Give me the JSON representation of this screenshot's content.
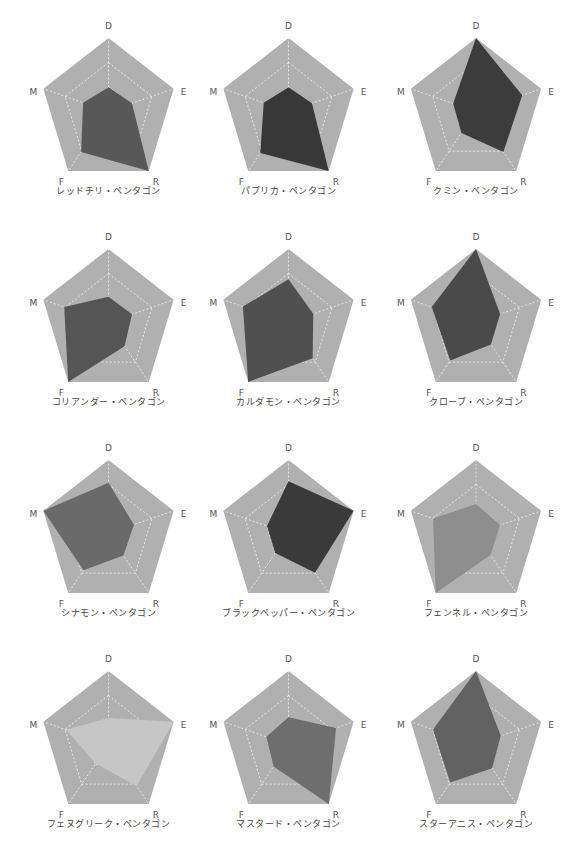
{
  "chart_data": [
    {
      "type": "radar",
      "title": "レッドチリ・ペンタゴン",
      "axes": [
        "D",
        "E",
        "R",
        "F",
        "M"
      ],
      "values": [
        0.33,
        0.36,
        1.0,
        0.68,
        0.39
      ],
      "range": [
        0,
        1
      ],
      "fill": "#585858"
    },
    {
      "type": "radar",
      "title": "パプリカ・ペンタゴン",
      "axes": [
        "D",
        "E",
        "R",
        "F",
        "M"
      ],
      "values": [
        0.33,
        0.36,
        1.0,
        0.7,
        0.38
      ],
      "range": [
        0,
        1
      ],
      "fill": "#383838"
    },
    {
      "type": "radar",
      "title": "クミン・ペンタゴン",
      "axes": [
        "D",
        "E",
        "R",
        "F",
        "M"
      ],
      "values": [
        1.0,
        0.71,
        0.68,
        0.36,
        0.35
      ],
      "range": [
        0,
        1
      ],
      "fill": "#3c3c3c"
    },
    {
      "type": "radar",
      "title": "コリアンダー・ペンタゴン",
      "axes": [
        "D",
        "E",
        "R",
        "F",
        "M"
      ],
      "values": [
        0.35,
        0.36,
        0.4,
        1.0,
        0.68
      ],
      "range": [
        0,
        1
      ],
      "fill": "#555555"
    },
    {
      "type": "radar",
      "title": "カルダモン・ペンタゴン",
      "axes": [
        "D",
        "E",
        "R",
        "F",
        "M"
      ],
      "values": [
        0.59,
        0.38,
        0.6,
        1.0,
        0.7
      ],
      "range": [
        0,
        1
      ],
      "fill": "#505050"
    },
    {
      "type": "radar",
      "title": "クローブ・ペンタゴン",
      "axes": [
        "D",
        "E",
        "R",
        "F",
        "M"
      ],
      "values": [
        1.0,
        0.37,
        0.37,
        0.64,
        0.68
      ],
      "range": [
        0,
        1
      ],
      "fill": "#4a4a4a"
    },
    {
      "type": "radar",
      "title": "シナモン・ペンタゴン",
      "axes": [
        "D",
        "E",
        "R",
        "F",
        "M"
      ],
      "values": [
        0.69,
        0.39,
        0.37,
        0.62,
        1.0
      ],
      "range": [
        0,
        1
      ],
      "fill": "#6a6a6a"
    },
    {
      "type": "radar",
      "title": "ブラックペッパー・ペンタゴン",
      "axes": [
        "D",
        "E",
        "R",
        "F",
        "M"
      ],
      "values": [
        0.71,
        1.0,
        0.66,
        0.33,
        0.33
      ],
      "range": [
        0,
        1
      ],
      "fill": "#3a3a3a"
    },
    {
      "type": "radar",
      "title": "フェンネル・ペンタゴン",
      "axes": [
        "D",
        "E",
        "R",
        "F",
        "M"
      ],
      "values": [
        0.4,
        0.37,
        0.36,
        1.0,
        0.66
      ],
      "range": [
        0,
        1
      ],
      "fill": "#8e8e8e"
    },
    {
      "type": "radar",
      "title": "フェヌグリーク・ペンタゴン",
      "axes": [
        "D",
        "E",
        "R",
        "F",
        "M"
      ],
      "values": [
        0.36,
        1.0,
        0.7,
        0.32,
        0.65
      ],
      "range": [
        0,
        1
      ],
      "fill": "#c6c6c6"
    },
    {
      "type": "radar",
      "title": "マスタード・ペンタゴン",
      "axes": [
        "D",
        "E",
        "R",
        "F",
        "M"
      ],
      "values": [
        0.37,
        0.73,
        1.0,
        0.37,
        0.34
      ],
      "range": [
        0,
        1
      ],
      "fill": "#6e6e6e"
    },
    {
      "type": "radar",
      "title": "スターアニス・ペンタゴン",
      "axes": [
        "D",
        "E",
        "R",
        "F",
        "M"
      ],
      "values": [
        1.0,
        0.38,
        0.4,
        0.64,
        0.66
      ],
      "range": [
        0,
        1
      ],
      "fill": "#626262"
    }
  ],
  "style": {
    "background_pentagon": "#b0b0b0",
    "grid_color": "#ffffff",
    "grid_rings": 3
  }
}
